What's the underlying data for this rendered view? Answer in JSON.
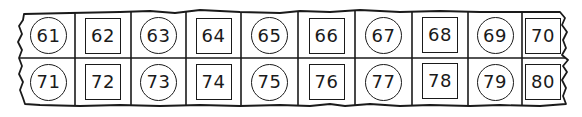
{
  "worksheet": {
    "stroke_color": "#1a1a1a",
    "background": "#ffffff",
    "rows": [
      {
        "cells": [
          {
            "number": "61",
            "shape": "circle"
          },
          {
            "number": "62",
            "shape": "square"
          },
          {
            "number": "63",
            "shape": "circle"
          },
          {
            "number": "64",
            "shape": "square"
          },
          {
            "number": "65",
            "shape": "circle"
          },
          {
            "number": "66",
            "shape": "square"
          },
          {
            "number": "67",
            "shape": "circle"
          },
          {
            "number": "68",
            "shape": "square"
          },
          {
            "number": "69",
            "shape": "circle"
          },
          {
            "number": "70",
            "shape": "square"
          }
        ]
      },
      {
        "cells": [
          {
            "number": "71",
            "shape": "circle"
          },
          {
            "number": "72",
            "shape": "square"
          },
          {
            "number": "73",
            "shape": "circle"
          },
          {
            "number": "74",
            "shape": "square"
          },
          {
            "number": "75",
            "shape": "circle"
          },
          {
            "number": "76",
            "shape": "square"
          },
          {
            "number": "77",
            "shape": "circle"
          },
          {
            "number": "78",
            "shape": "square"
          },
          {
            "number": "79",
            "shape": "circle"
          },
          {
            "number": "80",
            "shape": "square"
          }
        ]
      }
    ]
  }
}
